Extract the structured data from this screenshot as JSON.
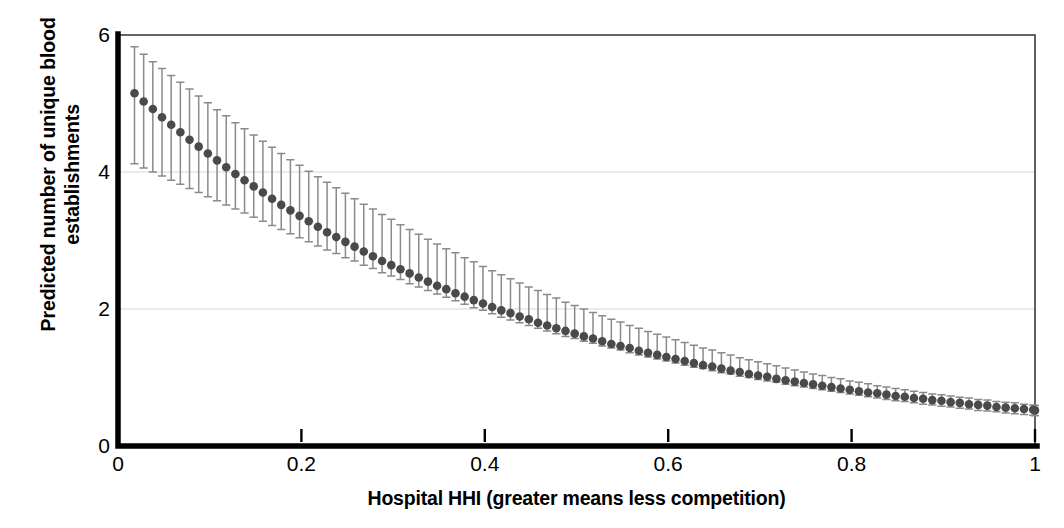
{
  "chart": {
    "type": "scatter-errorbar",
    "title": "",
    "xlabel": "Hospital HHI (greater means less competition)",
    "ylabel_line1": "Predicted number of unique blood",
    "ylabel_line2": "establishments",
    "ylabel": "Predicted number of unique blood establishments",
    "xticks": [
      "0",
      "0.2",
      "0.4",
      "0.6",
      "0.8",
      "1"
    ],
    "xtick_values": [
      0,
      0.2,
      0.4,
      0.6,
      0.8,
      1
    ],
    "yticks": [
      "0",
      "2",
      "4",
      "6"
    ],
    "ytick_values": [
      0,
      2,
      4,
      6
    ],
    "xlim": [
      0,
      1
    ],
    "ylim": [
      0,
      6
    ],
    "grid": "horizontal",
    "marker_color": "#4a4a4a",
    "errorbar_color": "#8a8a8a",
    "axis_color": "#000000",
    "grid_color": "#d7d7d7",
    "background": "#ffffff"
  },
  "chart_data": {
    "type": "scatter",
    "title": "",
    "xlabel": "Hospital HHI (greater means less competition)",
    "ylabel": "Predicted number of unique blood establishments",
    "xlim": [
      0,
      1
    ],
    "ylim": [
      0,
      6
    ],
    "grid": true,
    "legend": "none",
    "series": [
      {
        "name": "Predicted number of unique blood establishments",
        "marker": "circle",
        "color": "#4a4a4a",
        "errorbar": "95% confidence interval",
        "x": [
          0.018,
          0.028,
          0.038,
          0.048,
          0.058,
          0.068,
          0.078,
          0.088,
          0.098,
          0.108,
          0.118,
          0.128,
          0.138,
          0.148,
          0.158,
          0.168,
          0.178,
          0.188,
          0.198,
          0.208,
          0.218,
          0.228,
          0.238,
          0.248,
          0.258,
          0.268,
          0.278,
          0.288,
          0.298,
          0.308,
          0.318,
          0.328,
          0.338,
          0.348,
          0.358,
          0.368,
          0.378,
          0.388,
          0.398,
          0.408,
          0.418,
          0.428,
          0.438,
          0.448,
          0.458,
          0.468,
          0.478,
          0.488,
          0.498,
          0.508,
          0.518,
          0.528,
          0.538,
          0.548,
          0.558,
          0.568,
          0.578,
          0.588,
          0.598,
          0.608,
          0.618,
          0.628,
          0.638,
          0.648,
          0.658,
          0.668,
          0.678,
          0.688,
          0.698,
          0.708,
          0.718,
          0.728,
          0.738,
          0.748,
          0.758,
          0.768,
          0.778,
          0.788,
          0.798,
          0.808,
          0.818,
          0.828,
          0.838,
          0.848,
          0.858,
          0.868,
          0.878,
          0.888,
          0.898,
          0.908,
          0.918,
          0.928,
          0.938,
          0.948,
          0.958,
          0.968,
          0.978,
          0.988,
          0.998,
          1.0
        ],
        "y": [
          5.15,
          5.03,
          4.92,
          4.8,
          4.69,
          4.58,
          4.47,
          4.37,
          4.27,
          4.17,
          4.07,
          3.97,
          3.88,
          3.79,
          3.7,
          3.61,
          3.52,
          3.44,
          3.36,
          3.28,
          3.2,
          3.12,
          3.05,
          2.98,
          2.91,
          2.84,
          2.77,
          2.7,
          2.64,
          2.58,
          2.52,
          2.46,
          2.4,
          2.34,
          2.29,
          2.23,
          2.18,
          2.13,
          2.08,
          2.03,
          1.98,
          1.94,
          1.89,
          1.85,
          1.8,
          1.76,
          1.72,
          1.68,
          1.64,
          1.6,
          1.57,
          1.53,
          1.49,
          1.46,
          1.43,
          1.39,
          1.36,
          1.33,
          1.3,
          1.27,
          1.24,
          1.21,
          1.18,
          1.16,
          1.13,
          1.1,
          1.08,
          1.05,
          1.03,
          1.01,
          0.98,
          0.96,
          0.94,
          0.92,
          0.9,
          0.88,
          0.86,
          0.84,
          0.82,
          0.8,
          0.78,
          0.77,
          0.75,
          0.73,
          0.72,
          0.7,
          0.69,
          0.67,
          0.66,
          0.64,
          0.63,
          0.61,
          0.6,
          0.59,
          0.57,
          0.56,
          0.55,
          0.54,
          0.53,
          0.52
        ],
        "y_lower": [
          4.12,
          4.06,
          4.0,
          3.94,
          3.88,
          3.82,
          3.76,
          3.7,
          3.64,
          3.58,
          3.52,
          3.46,
          3.4,
          3.34,
          3.28,
          3.22,
          3.16,
          3.1,
          3.04,
          2.98,
          2.92,
          2.86,
          2.81,
          2.75,
          2.7,
          2.64,
          2.59,
          2.53,
          2.48,
          2.43,
          2.37,
          2.32,
          2.27,
          2.22,
          2.17,
          2.12,
          2.07,
          2.02,
          1.98,
          1.93,
          1.88,
          1.84,
          1.8,
          1.76,
          1.72,
          1.68,
          1.64,
          1.6,
          1.57,
          1.53,
          1.5,
          1.46,
          1.43,
          1.4,
          1.36,
          1.33,
          1.3,
          1.27,
          1.24,
          1.21,
          1.18,
          1.15,
          1.13,
          1.1,
          1.07,
          1.05,
          1.02,
          1.0,
          0.97,
          0.95,
          0.93,
          0.9,
          0.88,
          0.86,
          0.84,
          0.82,
          0.8,
          0.78,
          0.76,
          0.74,
          0.72,
          0.7,
          0.68,
          0.66,
          0.65,
          0.63,
          0.61,
          0.6,
          0.58,
          0.57,
          0.55,
          0.54,
          0.52,
          0.51,
          0.5,
          0.48,
          0.47,
          0.46,
          0.45,
          0.44
        ],
        "y_upper": [
          5.83,
          5.72,
          5.61,
          5.51,
          5.41,
          5.31,
          5.21,
          5.11,
          5.01,
          4.91,
          4.82,
          4.72,
          4.63,
          4.54,
          4.45,
          4.36,
          4.27,
          4.18,
          4.1,
          4.01,
          3.93,
          3.85,
          3.77,
          3.69,
          3.61,
          3.53,
          3.46,
          3.38,
          3.31,
          3.23,
          3.16,
          3.09,
          3.02,
          2.95,
          2.88,
          2.82,
          2.75,
          2.69,
          2.62,
          2.56,
          2.5,
          2.44,
          2.38,
          2.32,
          2.27,
          2.21,
          2.16,
          2.1,
          2.05,
          2.0,
          1.95,
          1.9,
          1.85,
          1.81,
          1.76,
          1.72,
          1.67,
          1.63,
          1.59,
          1.55,
          1.51,
          1.47,
          1.43,
          1.4,
          1.36,
          1.33,
          1.29,
          1.26,
          1.23,
          1.2,
          1.17,
          1.14,
          1.11,
          1.08,
          1.05,
          1.03,
          1.0,
          0.98,
          0.95,
          0.93,
          0.91,
          0.88,
          0.86,
          0.84,
          0.82,
          0.8,
          0.78,
          0.76,
          0.75,
          0.73,
          0.71,
          0.7,
          0.68,
          0.67,
          0.65,
          0.64,
          0.63,
          0.61,
          0.6,
          0.59
        ]
      }
    ]
  }
}
